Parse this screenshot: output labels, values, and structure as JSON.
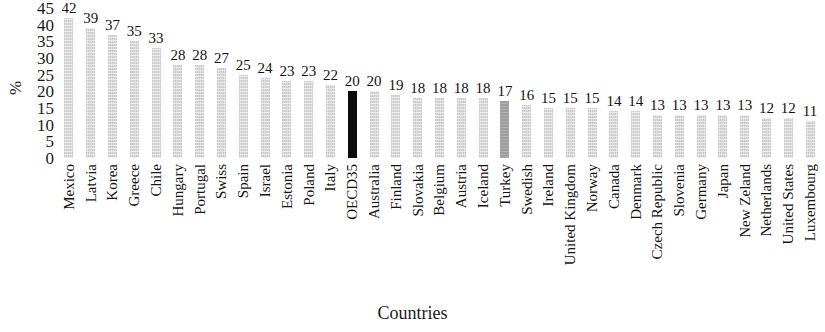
{
  "chart_data": {
    "type": "bar",
    "title": "",
    "xlabel": "Countries",
    "ylabel": "%",
    "ylim": [
      0,
      45
    ],
    "ytick_step": 5,
    "yticks": [
      45,
      40,
      35,
      30,
      25,
      20,
      15,
      10,
      5,
      0
    ],
    "grid": false,
    "legend": null,
    "categories": [
      "Mexico",
      "Latvia",
      "Korea",
      "Greece",
      "Chile",
      "Hungary",
      "Portugal",
      "Swiss",
      "Spain",
      "Israel",
      "Estonia",
      "Poland",
      "Italy",
      "OECD35",
      "Australia",
      "Finland",
      "Slovakia",
      "Belgium",
      "Austria",
      "Iceland",
      "Turkey",
      "Swedish",
      "Ireland",
      "United Kingdom",
      "Norway",
      "Canada",
      "Denmark",
      "Czech Republic",
      "Slovenia",
      "Germany",
      "Japan",
      "New Zeland",
      "Netherlands",
      "United States",
      "Luxembourg"
    ],
    "values": [
      42,
      39,
      37,
      35,
      33,
      28,
      28,
      27,
      25,
      24,
      23,
      23,
      22,
      20,
      20,
      19,
      18,
      18,
      18,
      18,
      17,
      16,
      15,
      15,
      15,
      14,
      14,
      13,
      13,
      13,
      13,
      13,
      12,
      12,
      11
    ],
    "bar_styles": [
      "default",
      "default",
      "default",
      "default",
      "default",
      "default",
      "default",
      "default",
      "default",
      "default",
      "default",
      "default",
      "default",
      "black",
      "default",
      "default",
      "default",
      "default",
      "default",
      "default",
      "gray",
      "default",
      "default",
      "default",
      "default",
      "default",
      "default",
      "default",
      "default",
      "default",
      "default",
      "default",
      "default",
      "default",
      "default"
    ],
    "colors": {
      "bar_default": "#dcdcdc",
      "bar_highlight_black": "#0b0b0b",
      "bar_highlight_gray": "#9e9e9e",
      "background": "#ffffff",
      "text": "#1a1a1a"
    }
  }
}
